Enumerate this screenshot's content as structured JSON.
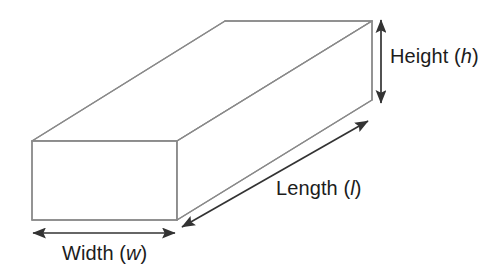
{
  "diagram": {
    "name": "rectangular-prism-dimensions",
    "background_color": "#ffffff",
    "shape": {
      "name": "rectangular-prism",
      "edge_color": "#8a8a8a",
      "face_color": "#ffffff",
      "edge_width": 1.4
    },
    "annotation_color": "#333333",
    "labels": {
      "height": {
        "text": "Height",
        "open_paren": "(",
        "variable": "h",
        "close_paren": ")"
      },
      "length": {
        "text": "Length",
        "open_paren": "(",
        "variable": "l",
        "close_paren": ")"
      },
      "width": {
        "text": "Width",
        "open_paren": "(",
        "variable": "w",
        "close_paren": ")"
      }
    },
    "dimension_arrows": [
      {
        "name": "height-arrow",
        "orientation": "vertical",
        "from": [
          381,
          18
        ],
        "to": [
          381,
          104
        ],
        "heads": "both"
      },
      {
        "name": "length-arrow",
        "orientation": "diagonal",
        "from": [
          180,
          228
        ],
        "to": [
          370,
          119
        ],
        "heads": "both"
      },
      {
        "name": "width-arrow",
        "orientation": "horizontal",
        "from": [
          31,
          233
        ],
        "to": [
          176,
          233
        ],
        "heads": "both"
      }
    ],
    "vertices": {
      "front_top_left": [
        32,
        141
      ],
      "front_top_right": [
        177,
        141
      ],
      "front_bottom_right": [
        177,
        220
      ],
      "front_bottom_left": [
        32,
        220
      ],
      "back_top_left": [
        225,
        21
      ],
      "back_top_right": [
        372,
        21
      ],
      "back_bottom_right": [
        372,
        100
      ]
    }
  }
}
